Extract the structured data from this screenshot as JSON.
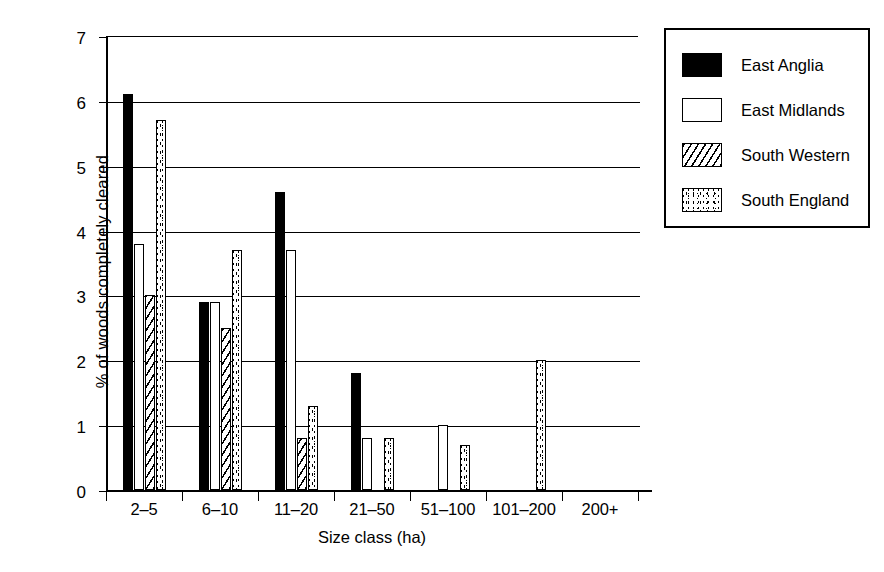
{
  "chart_data": {
    "type": "bar",
    "title": "",
    "xlabel": "Size class (ha)",
    "ylabel": "% of woods completely cleared",
    "categories": [
      "2–5",
      "6–10",
      "11–20",
      "21–50",
      "51–100",
      "101–200",
      "200+"
    ],
    "ylim": [
      0,
      7
    ],
    "yticks": [
      "0",
      "1",
      "2",
      "3",
      "4",
      "5",
      "6",
      "7"
    ],
    "grid": "horizontal",
    "legend_position": "right-outside",
    "series": [
      {
        "name": "East Anglia",
        "pattern": "solid-black",
        "values": [
          6.1,
          2.9,
          4.6,
          1.8,
          0,
          0,
          0
        ]
      },
      {
        "name": "East Midlands",
        "pattern": "open-white",
        "values": [
          3.8,
          2.9,
          3.7,
          0.8,
          1.0,
          0,
          0
        ]
      },
      {
        "name": "South Western",
        "pattern": "diagonal-hatch",
        "values": [
          3.0,
          2.5,
          0.8,
          0,
          0,
          0,
          0
        ]
      },
      {
        "name": "South England",
        "pattern": "stipple-dots",
        "values": [
          5.7,
          3.7,
          1.3,
          0.8,
          0.7,
          2.0,
          0
        ]
      }
    ]
  },
  "colors": {
    "foreground": "#000000",
    "background": "#ffffff"
  }
}
